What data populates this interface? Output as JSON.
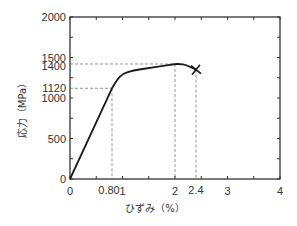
{
  "chart_data": {
    "type": "line",
    "title": "",
    "xlabel": "ひずみ（%）",
    "ylabel": "応力（MPa）",
    "xlim": [
      0,
      4
    ],
    "ylim": [
      0,
      2000
    ],
    "grid": false,
    "legend": null,
    "x_ticks": [
      0,
      1,
      2,
      3,
      4
    ],
    "x_tick_labels": [
      "0",
      "1",
      "2",
      "3",
      "4"
    ],
    "x_extra_labels": [
      {
        "value": 0.8,
        "label": "0.80"
      },
      {
        "value": 2.4,
        "label": "2.4"
      }
    ],
    "y_ticks": [
      0,
      500,
      1000,
      1500,
      2000
    ],
    "y_tick_labels": [
      "0",
      "500",
      "1000",
      "1500",
      "2000"
    ],
    "y_extra_labels": [
      {
        "value": 1120,
        "label": "1120"
      },
      {
        "value": 1400,
        "label": "1400"
      }
    ],
    "series": [
      {
        "name": "stress-strain",
        "x": [
          0,
          0.4,
          0.8,
          0.9,
          1.0,
          1.2,
          1.5,
          1.8,
          2.0,
          2.1,
          2.2,
          2.3,
          2.4
        ],
        "y": [
          0,
          560,
          1120,
          1230,
          1300,
          1340,
          1370,
          1400,
          1420,
          1420,
          1410,
          1380,
          1350
        ]
      }
    ],
    "annotations": [
      {
        "type": "dashed-guide",
        "x": 0.8,
        "y": 1120,
        "description": "proportional limit"
      },
      {
        "type": "dashed-guide",
        "x": 2.0,
        "y": 1400,
        "description": "tensile strength"
      },
      {
        "type": "dashed-guide",
        "x": 2.4,
        "description": "fracture strain"
      },
      {
        "type": "marker",
        "shape": "x",
        "x": 2.4,
        "y": 1350,
        "description": "fracture point"
      }
    ],
    "colors": {
      "line": "#1a1a1a",
      "axis": "#333333",
      "guide": "#888888"
    }
  }
}
